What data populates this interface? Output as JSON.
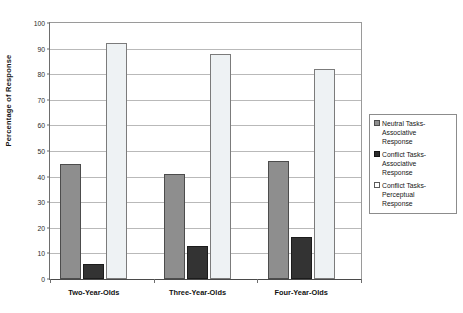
{
  "chart_data": {
    "type": "bar",
    "title": "",
    "xlabel": "",
    "ylabel": "Percentage of Response",
    "ylim": [
      0,
      100
    ],
    "ytick_step": 10,
    "yticks": [
      100,
      90,
      80,
      70,
      60,
      50,
      40,
      30,
      20,
      10,
      0
    ],
    "grid": true,
    "legend_position": "right",
    "categories": [
      "Two-Year-Olds",
      "Three-Year-Olds",
      "Four-Year-Olds"
    ],
    "series": [
      {
        "name": "Neutral Tasks-Associative Response",
        "name_lines": [
          "Neutral Tasks-",
          "Associative",
          "Response"
        ],
        "color": "#8e8e8e",
        "values": [
          45,
          41,
          46
        ]
      },
      {
        "name": "Conflict Tasks-Associative Response",
        "name_lines": [
          "Conflict Tasks-",
          "Associative",
          "Response"
        ],
        "color": "#2b2b2b",
        "values": [
          6,
          13,
          16.5
        ]
      },
      {
        "name": "Conflict Tasks-Perceptual Response",
        "name_lines": [
          "Conflict Tasks-",
          "Perceptual",
          "Response"
        ],
        "color": "#ffffff",
        "values": [
          92,
          88,
          82
        ]
      }
    ]
  },
  "axis": {
    "y_title": "Percentage of Response"
  },
  "legend": {
    "entries": [
      {
        "line1": "Neutral Tasks-",
        "line2": "Associative",
        "line3": "Response"
      },
      {
        "line1": "Conflict Tasks-",
        "line2": "Associative",
        "line3": "Response"
      },
      {
        "line1": "Conflict Tasks-",
        "line2": "Perceptual",
        "line3": "Response"
      }
    ]
  },
  "clipped_header": ""
}
